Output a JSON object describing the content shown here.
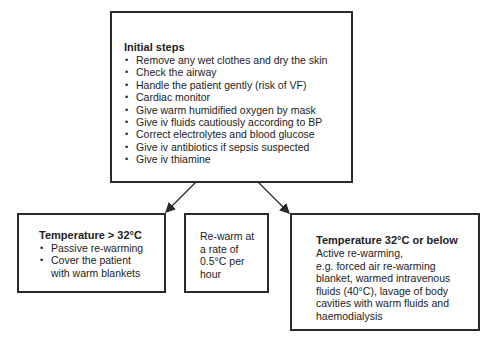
{
  "diagram": {
    "initial": {
      "title": "Initial steps",
      "items": [
        "Remove any wet clothes and dry the skin",
        "Check the airway",
        "Handle the patient gently (risk of VF)",
        "Cardiac monitor",
        "Give warm humidified oxygen by mask",
        "Give iv fluids cautiously according to BP",
        "Correct electrolytes and blood glucose",
        "Give iv antibiotics if sepsis suspected",
        "Give iv thiamine"
      ]
    },
    "above32": {
      "title": "Temperature > 32°C",
      "items": [
        "Passive re-warming",
        "Cover the patient with warm blankets"
      ]
    },
    "rate": {
      "lines": [
        "Re-warm at",
        "a rate of",
        "0.5°C per",
        "hour"
      ]
    },
    "below32": {
      "title": "Temperature 32°C or below",
      "lines": [
        "Active re-warming,",
        "e.g. forced air re-warming",
        "blanket, warmed intravenous",
        "fluids (40°C), lavage of body",
        "cavities with warm fluids and",
        "haemodialysis"
      ]
    },
    "colors": {
      "stroke": "#2a2a2a",
      "background": "#ffffff"
    }
  }
}
